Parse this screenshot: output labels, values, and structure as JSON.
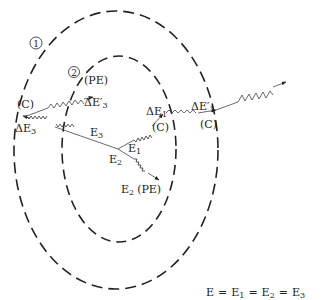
{
  "diagram": {
    "shells": [
      {
        "id": "shell-1",
        "label": "1"
      },
      {
        "id": "shell-2",
        "label": "2"
      }
    ],
    "labels": {
      "pe_top": "(PE)",
      "de3_prime": "ΔE′",
      "de3_prime_sub": "3",
      "c_left": "(C)",
      "de3": "ΔE",
      "de3_sub": "3",
      "e3": "E",
      "e3_sub": "3",
      "de1": "ΔE",
      "de1_sub": "1",
      "c_mid": "(C)",
      "e1": "E",
      "e1_sub": "1",
      "e2": "E",
      "e2_sub": "2",
      "e2_pe": "E",
      "e2_pe_sub": "2",
      "e2_pe_tag": "(PE)",
      "de1_prime": "ΔE′",
      "de1_prime_sub": "1",
      "c_right": "(C)"
    },
    "equation": {
      "e": "E",
      "eq": "=",
      "e1": "E",
      "e1_sub": "1",
      "e2": "E",
      "e2_sub": "2",
      "e3": "E",
      "e3_sub": "3"
    },
    "colors": {
      "stroke": "#222222",
      "background": "#ffffff"
    }
  }
}
